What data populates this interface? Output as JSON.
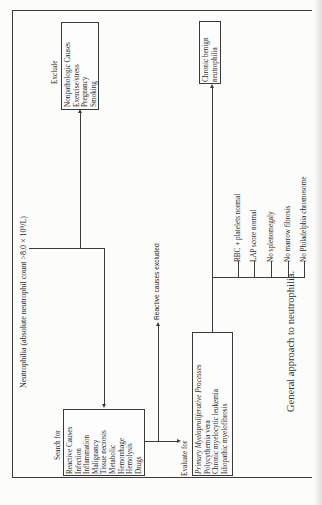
{
  "figure": {
    "caption": "General approach to neutrophilia.",
    "root": "Neutrophilia (absolute neutrophil count >8.0 × 10⁹/L)",
    "exclude": {
      "label": "Exclude",
      "items": [
        "Nonpathologic Causes",
        "Exercise/stress",
        "Pregnancy",
        "Smoking"
      ]
    },
    "search": {
      "label": "Search for",
      "items": [
        "Reactive Causes",
        "Infection",
        "Inflammation",
        "Malignancy",
        "Tissue necrosis",
        "Metabolic",
        "Hemorrhage",
        "Hemolysis",
        "Drugs"
      ]
    },
    "reactive_excluded": "Reactive causes excluded",
    "evaluate": {
      "label": "Evaluate for",
      "items": [
        "Primary Myeloproliferative Processes",
        "Polycythemia vera",
        "Chronic myelocytic leukemia",
        "Idiopathic myelofibrosis"
      ]
    },
    "criteria": [
      "RBC + platelets normal",
      "LAP score normal",
      "No splenomegaly",
      "No marrow fibrosis",
      "No Philadelphia chromosome"
    ],
    "outcome": [
      "Chronic benign",
      "neutrophilia"
    ]
  }
}
